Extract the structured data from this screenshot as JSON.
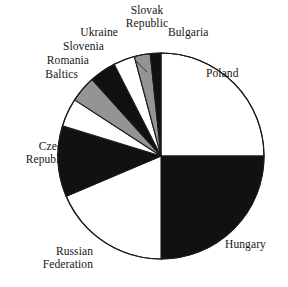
{
  "figure": {
    "width": 288,
    "height": 287,
    "background": "#ffffff",
    "outline_color": "#1a1a1a"
  },
  "palette": {
    "white": "#ffffff",
    "black": "#111111",
    "gray": "#949494",
    "stroke": "#1a1a1a"
  },
  "chart_data": {
    "type": "pie",
    "title": "",
    "subtitle": "",
    "xlabel": "",
    "ylabel": "",
    "legend_position": "none",
    "grid": false,
    "label_placement": "outside-leader",
    "start_angle_deg": 0,
    "direction": "clockwise",
    "center": {
      "x": 161,
      "y": 156
    },
    "radius": 103,
    "categories": [
      "Poland",
      "Hungary",
      "Russian Federation",
      "Czech Republic",
      "Baltics",
      "Romania",
      "Slovenia",
      "Ukraine",
      "Slovak Republic",
      "Bulgaria"
    ],
    "values": [
      25.0,
      25.0,
      18.6,
      11.1,
      4.4,
      4.2,
      4.2,
      3.3,
      2.5,
      1.7
    ],
    "slices": [
      {
        "label": "Poland",
        "value": 25.0,
        "fill": "#ffffff",
        "start_deg": 0.0,
        "end_deg": 90.0
      },
      {
        "label": "Hungary",
        "value": 25.0,
        "fill": "#111111",
        "start_deg": 90.0,
        "end_deg": 180.0
      },
      {
        "label": "Russian Federation",
        "value": 18.6,
        "fill": "#ffffff",
        "start_deg": 180.0,
        "end_deg": 247.0
      },
      {
        "label": "Czech Republic",
        "value": 11.1,
        "fill": "#111111",
        "start_deg": 247.0,
        "end_deg": 287.0
      },
      {
        "label": "Baltics",
        "value": 4.4,
        "fill": "#ffffff",
        "start_deg": 287.0,
        "end_deg": 303.0
      },
      {
        "label": "Romania",
        "value": 4.2,
        "fill": "#949494",
        "start_deg": 303.0,
        "end_deg": 318.0
      },
      {
        "label": "Slovenia",
        "value": 4.2,
        "fill": "#111111",
        "start_deg": 318.0,
        "end_deg": 333.0
      },
      {
        "label": "Ukraine",
        "value": 3.3,
        "fill": "#ffffff",
        "start_deg": 333.0,
        "end_deg": 345.0
      },
      {
        "label": "Slovak Republic",
        "value": 2.5,
        "fill": "#949494",
        "start_deg": 345.0,
        "end_deg": 354.0
      },
      {
        "label": "Bulgaria",
        "value": 1.7,
        "fill": "#111111",
        "start_deg": 354.0,
        "end_deg": 360.0
      }
    ]
  },
  "labels": [
    {
      "name": "poland",
      "text": "Poland",
      "x": 206,
      "y": 67,
      "align": "lbl-right"
    },
    {
      "name": "hungary",
      "text": "Hungary",
      "x": 225,
      "y": 238,
      "align": "lbl-right"
    },
    {
      "name": "russian-federation",
      "text": "Russian\nFederation",
      "x": 93,
      "y": 245,
      "align": "lbl-left"
    },
    {
      "name": "czech-republic",
      "text": "Czech\nRepublic",
      "x": 68,
      "y": 140,
      "align": "lbl-left"
    },
    {
      "name": "baltics",
      "text": "Baltics",
      "x": 78,
      "y": 68,
      "align": "lbl-left"
    },
    {
      "name": "romania",
      "text": "Romania",
      "x": 89,
      "y": 54,
      "align": "lbl-left"
    },
    {
      "name": "slovenia",
      "text": "Slovenia",
      "x": 104,
      "y": 40,
      "align": "lbl-left"
    },
    {
      "name": "ukraine",
      "text": "Ukraine",
      "x": 118,
      "y": 26,
      "align": "lbl-left"
    },
    {
      "name": "slovak-republic",
      "text": "Slovak\nRepublic",
      "x": 147,
      "y": 4,
      "align": "lbl-center"
    },
    {
      "name": "bulgaria",
      "text": "Bulgaria",
      "x": 168,
      "y": 26,
      "align": "lbl-right"
    }
  ],
  "leaders": [
    {
      "name": "leader-slovenia",
      "x1": 135,
      "y1": 60,
      "x2": 147,
      "y2": 72
    },
    {
      "name": "leader-baltics",
      "x1": 113,
      "y1": 80,
      "x2": 125,
      "y2": 90
    }
  ]
}
